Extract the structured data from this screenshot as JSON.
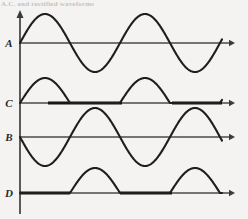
{
  "figure": {
    "caption_remnant": "A.C. and rectified waveforms",
    "background_color": "#f4f3f1",
    "wave_color": "#1e1e1e",
    "axis_color": "#4a4a4a",
    "baseline_color": "#151515"
  },
  "axes": {
    "vertical_axis_x": 20,
    "vertical_axis_top": 14,
    "vertical_axis_bottom": 214,
    "axis_right_end": 235,
    "arrow_size": 5
  },
  "traces": [
    {
      "label": "A",
      "label_x": 9,
      "label_y": 47,
      "baseline_y": 43,
      "amplitude": 29,
      "period": 100,
      "phase": "positive-first",
      "type": "full-sine",
      "x_start": 20,
      "x_end": 222,
      "thick_baseline_segments": []
    },
    {
      "label": "C",
      "label_x": 9,
      "label_y": 107,
      "baseline_y": 103,
      "amplitude": 25,
      "period": 100,
      "phase": "positive-first",
      "type": "half-wave-rectified",
      "x_start": 20,
      "x_end": 222,
      "thick_baseline_segments": [
        [
          48,
          122
        ],
        [
          172,
          222
        ]
      ]
    },
    {
      "label": "B",
      "label_x": 9,
      "label_y": 141,
      "baseline_y": 137,
      "amplitude": 29,
      "period": 100,
      "phase": "negative-first",
      "type": "full-sine",
      "x_start": 20,
      "x_end": 222,
      "thick_baseline_segments": []
    },
    {
      "label": "D",
      "label_x": 9,
      "label_y": 197,
      "baseline_y": 193,
      "amplitude": 25,
      "period": 100,
      "phase": "negative-first",
      "type": "half-wave-rectified",
      "x_start": 20,
      "x_end": 222,
      "thick_baseline_segments": [
        [
          20,
          70
        ],
        [
          120,
          172
        ]
      ]
    }
  ],
  "chart_data": {
    "type": "line",
    "title": "A.C. and rectified waveforms",
    "xlabel": "",
    "ylabel": "",
    "grid": false,
    "legend": "none",
    "x_axis_note": "time, ~2 cycles shown, period 100 px",
    "series": [
      {
        "name": "A",
        "description": "Sinusoidal alternating waveform, full sine, starts at zero rising positive",
        "waveform": "sine",
        "amplitude": 1.0,
        "cycles": 2,
        "phase_deg": 0,
        "rectified": false,
        "key_points": [
          {
            "x": 0,
            "y": 0
          },
          {
            "x": 25,
            "y": 1.0
          },
          {
            "x": 50,
            "y": 0
          },
          {
            "x": 75,
            "y": -1.0
          },
          {
            "x": 100,
            "y": 0
          },
          {
            "x": 125,
            "y": 1.0
          },
          {
            "x": 150,
            "y": 0
          },
          {
            "x": 175,
            "y": -1.0
          },
          {
            "x": 200,
            "y": 0
          }
        ]
      },
      {
        "name": "C",
        "description": "Half-wave rectified version of A: positive half cycles retained, negative halves clamped to zero",
        "waveform": "half-wave-rectified-sine",
        "amplitude": 0.86,
        "cycles": 2,
        "phase_deg": 0,
        "rectified": true,
        "key_points": [
          {
            "x": 0,
            "y": 0
          },
          {
            "x": 25,
            "y": 0.86
          },
          {
            "x": 50,
            "y": 0
          },
          {
            "x": 75,
            "y": 0
          },
          {
            "x": 100,
            "y": 0
          },
          {
            "x": 125,
            "y": 0.86
          },
          {
            "x": 150,
            "y": 0
          },
          {
            "x": 175,
            "y": 0
          },
          {
            "x": 200,
            "y": 0
          }
        ]
      },
      {
        "name": "B",
        "description": "Sinusoidal alternating waveform inverted relative to A, starts at zero falling negative",
        "waveform": "sine",
        "amplitude": 1.0,
        "cycles": 2,
        "phase_deg": 180,
        "rectified": false,
        "key_points": [
          {
            "x": 0,
            "y": 0
          },
          {
            "x": 25,
            "y": -1.0
          },
          {
            "x": 50,
            "y": 0
          },
          {
            "x": 75,
            "y": 1.0
          },
          {
            "x": 100,
            "y": 0
          },
          {
            "x": 125,
            "y": -1.0
          },
          {
            "x": 150,
            "y": 0
          },
          {
            "x": 175,
            "y": 1.0
          },
          {
            "x": 200,
            "y": 0
          }
        ]
      },
      {
        "name": "D",
        "description": "Half-wave rectified version of B: the half cycles that are positive in B are retained, others clamped to zero",
        "waveform": "half-wave-rectified-sine",
        "amplitude": 0.86,
        "cycles": 2,
        "phase_deg": 180,
        "rectified": true,
        "key_points": [
          {
            "x": 0,
            "y": 0
          },
          {
            "x": 25,
            "y": 0
          },
          {
            "x": 50,
            "y": 0
          },
          {
            "x": 75,
            "y": 0.86
          },
          {
            "x": 100,
            "y": 0
          },
          {
            "x": 125,
            "y": 0
          },
          {
            "x": 150,
            "y": 0.86
          },
          {
            "x": 175,
            "y": 0
          },
          {
            "x": 200,
            "y": 0
          }
        ]
      }
    ]
  }
}
